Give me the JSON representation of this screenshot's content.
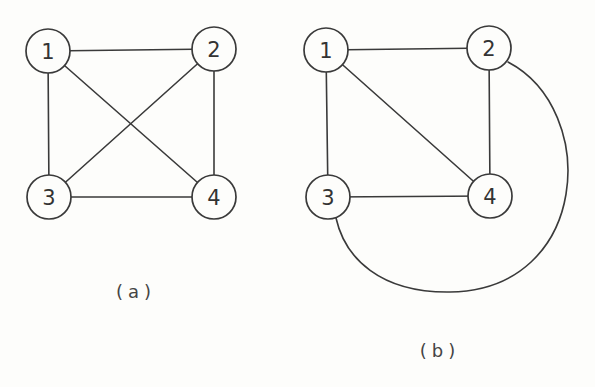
{
  "figures": [
    {
      "id": "a",
      "caption": "(a)",
      "caption_pos": {
        "x": 136,
        "y": 281
      },
      "nodes": [
        {
          "label": "1",
          "x": 48,
          "y": 51,
          "r": 22
        },
        {
          "label": "2",
          "x": 214,
          "y": 49,
          "r": 22
        },
        {
          "label": "3",
          "x": 49,
          "y": 197,
          "r": 22
        },
        {
          "label": "4",
          "x": 214,
          "y": 197,
          "r": 22
        }
      ],
      "edges": [
        {
          "from": "1",
          "to": "2",
          "type": "line"
        },
        {
          "from": "1",
          "to": "3",
          "type": "line"
        },
        {
          "from": "1",
          "to": "4",
          "type": "line"
        },
        {
          "from": "2",
          "to": "3",
          "type": "line"
        },
        {
          "from": "2",
          "to": "4",
          "type": "line"
        },
        {
          "from": "3",
          "to": "4",
          "type": "line"
        }
      ]
    },
    {
      "id": "b",
      "caption": "(b)",
      "caption_pos": {
        "x": 440,
        "y": 340
      },
      "nodes": [
        {
          "label": "1",
          "x": 326,
          "y": 50,
          "r": 22
        },
        {
          "label": "2",
          "x": 489,
          "y": 48,
          "r": 22
        },
        {
          "label": "3",
          "x": 328,
          "y": 197,
          "r": 22
        },
        {
          "label": "4",
          "x": 490,
          "y": 196,
          "r": 22
        }
      ],
      "edges": [
        {
          "from": "1",
          "to": "2",
          "type": "line"
        },
        {
          "from": "1",
          "to": "3",
          "type": "line"
        },
        {
          "from": "1",
          "to": "4",
          "type": "line"
        },
        {
          "from": "2",
          "to": "4",
          "type": "line"
        },
        {
          "from": "3",
          "to": "4",
          "type": "line"
        },
        {
          "from": "2",
          "to": "3",
          "type": "arc",
          "path": "M 508 62 C 600 110, 590 290, 450 292 C 380 293, 345 258, 336 218"
        }
      ]
    }
  ]
}
